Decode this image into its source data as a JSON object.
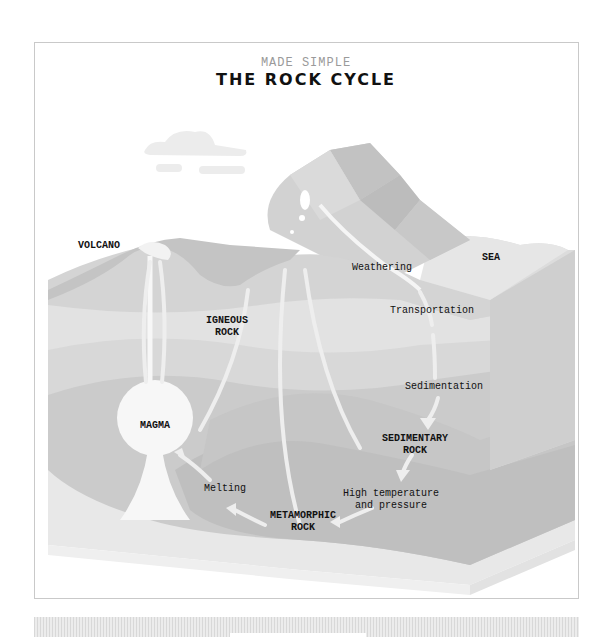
{
  "header": {
    "subtitle": "MADE SIMPLE",
    "title": "THE ROCK CYCLE"
  },
  "labels": {
    "volcano": "VOLCANO",
    "igneous_rock": "IGNEOUS\nROCK",
    "weathering": "Weathering",
    "sea": "SEA",
    "transportation": "Transportation",
    "sedimentation": "Sedimentation",
    "magma": "MAGMA",
    "sedimentary_rock": "SEDIMENTARY\nROCK",
    "melting": "Melting",
    "high_temp_pressure": "High temperature\nand pressure",
    "metamorphic_rock": "METAMORPHIC\nROCK"
  },
  "cycle_steps": [
    {
      "from": "Weathering",
      "to": "Transportation"
    },
    {
      "from": "Transportation",
      "to": "Sedimentation"
    },
    {
      "from": "Sedimentation",
      "to": "SEDIMENTARY ROCK"
    },
    {
      "from": "SEDIMENTARY ROCK",
      "to": "High temperature and pressure"
    },
    {
      "from": "High temperature and pressure",
      "to": "METAMORPHIC ROCK"
    },
    {
      "from": "METAMORPHIC ROCK",
      "to": "Melting"
    },
    {
      "from": "Melting",
      "to": "MAGMA"
    },
    {
      "from": "MAGMA",
      "to": "IGNEOUS ROCK"
    },
    {
      "from": "MAGMA",
      "to": "VOLCANO"
    }
  ],
  "colors": {
    "frame_border": "#c9c9c9",
    "layer_light": "#e6e6e6",
    "layer_mid": "#cfcfcf",
    "layer_dark": "#bdbdbd",
    "arrow": "#eeeeee",
    "text": "#111111",
    "subtitle": "#9a9a9a"
  }
}
